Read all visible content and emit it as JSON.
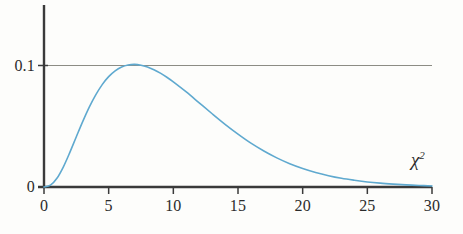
{
  "figure": {
    "background_color": "#fdfdfb",
    "width": 463,
    "height": 234
  },
  "chart_data": {
    "type": "line",
    "title": "",
    "subtitle": "",
    "xlabel": "χ²",
    "ylabel": "",
    "xlim": [
      0,
      30
    ],
    "ylim": [
      0,
      0.13
    ],
    "grid": false,
    "legend": null,
    "legend_position": "none",
    "axis_color": "#3a3a3a",
    "series": [
      {
        "name": "chi-square pdf (df = 9)",
        "color": "#5fa9cf",
        "line_width": 1.6,
        "x": [
          0,
          0.5,
          1,
          1.5,
          2,
          2.5,
          3,
          3.5,
          4,
          4.5,
          5,
          5.5,
          6,
          6.5,
          7,
          7.5,
          8,
          8.5,
          9,
          9.5,
          10,
          11,
          12,
          13,
          14,
          15,
          16,
          17,
          18,
          19,
          20,
          21,
          22,
          23,
          24,
          25,
          26,
          27,
          28,
          29,
          30
        ],
        "y": [
          0.0,
          0.0012,
          0.0057,
          0.0132,
          0.0226,
          0.0328,
          0.0428,
          0.0521,
          0.0601,
          0.0668,
          0.072,
          0.0758,
          0.0783,
          0.0796,
          0.08,
          0.0795,
          0.0783,
          0.0765,
          0.0743,
          0.0716,
          0.0686,
          0.062,
          0.0549,
          0.0478,
          0.0409,
          0.0345,
          0.0286,
          0.0235,
          0.019,
          0.0152,
          0.0121,
          0.0095,
          0.0074,
          0.0057,
          0.0044,
          0.0033,
          0.0025,
          0.0019,
          0.0014,
          0.001,
          0.0007
        ],
        "note": "y values listed here are the raw chi-square(9) density; the plotted curve is scaled so its mode reaches the 0.1 reference level"
      }
    ],
    "reference_lines": [
      {
        "name": "y-0.1-reference-line",
        "orientation": "horizontal",
        "value": 0.1,
        "color": "#8c8c84",
        "x_start": 0,
        "x_end": 30
      }
    ],
    "x_ticks": [
      {
        "value": 0,
        "label": "0"
      },
      {
        "value": 5,
        "label": "5"
      },
      {
        "value": 10,
        "label": "10"
      },
      {
        "value": 15,
        "label": "15"
      },
      {
        "value": 20,
        "label": "20"
      },
      {
        "value": 25,
        "label": "25"
      },
      {
        "value": 30,
        "label": "30"
      }
    ],
    "y_ticks": [
      {
        "value": 0,
        "label": "0"
      },
      {
        "value": 0.1,
        "label": "0.1"
      }
    ],
    "peak": {
      "x": 7,
      "y": 0.1009,
      "label": ""
    }
  }
}
